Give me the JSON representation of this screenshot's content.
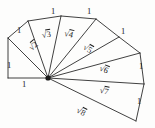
{
  "figure": {
    "type": "geometric-diagram",
    "background_color": "#fdfdfc",
    "stroke_color": "#2b2b2b",
    "text_color": "#1c1c1c",
    "hub": {
      "x": 48,
      "y": 78,
      "label": "origin"
    }
  },
  "unit_labels": [
    {
      "id": "unit-1",
      "text": "1",
      "x": 7,
      "y": 61
    },
    {
      "id": "unit-2",
      "text": "1",
      "x": 22,
      "y": 80
    },
    {
      "id": "unit-3",
      "text": "1",
      "x": 17,
      "y": 26
    },
    {
      "id": "unit-4",
      "text": "1",
      "x": 51,
      "y": 7
    },
    {
      "id": "unit-5",
      "text": "1",
      "x": 87,
      "y": 7
    },
    {
      "id": "unit-6",
      "text": "1",
      "x": 121,
      "y": 27
    },
    {
      "id": "unit-7",
      "text": "1",
      "x": 139,
      "y": 62
    },
    {
      "id": "unit-8",
      "text": "1",
      "x": 137,
      "y": 97
    }
  ],
  "hypotenuse_labels": [
    {
      "id": "sqrt-2",
      "sign": "√",
      "radicand": "2",
      "x": 26,
      "y": 44,
      "rotate": -40
    },
    {
      "id": "sqrt-3",
      "sign": "√",
      "radicand": "3",
      "x": 41,
      "y": 29,
      "rotate": -8
    },
    {
      "id": "sqrt-4",
      "sign": "√",
      "radicand": "4",
      "x": 66,
      "y": 27,
      "rotate": 14
    },
    {
      "id": "sqrt-5",
      "sign": "√",
      "radicand": "5",
      "x": 87,
      "y": 41,
      "rotate": 30
    },
    {
      "id": "sqrt-6",
      "sign": "√",
      "radicand": "6",
      "x": 102,
      "y": 62,
      "rotate": 22
    },
    {
      "id": "sqrt-7",
      "sign": "√",
      "radicand": "7",
      "x": 101,
      "y": 84,
      "rotate": 12
    },
    {
      "id": "sqrt-8",
      "sign": "√",
      "radicand": "8",
      "x": 80,
      "y": 104,
      "rotate": 28
    }
  ],
  "geometry": {
    "spokes": [
      {
        "id": "spoke-r1",
        "from": [
          48,
          78
        ],
        "to": [
          8,
          78
        ]
      },
      {
        "id": "spoke-r2",
        "from": [
          48,
          78
        ],
        "to": [
          8,
          38
        ]
      },
      {
        "id": "spoke-r3",
        "from": [
          48,
          78
        ],
        "to": [
          28,
          21
        ]
      },
      {
        "id": "spoke-r4",
        "from": [
          48,
          78
        ],
        "to": [
          61,
          16
        ]
      },
      {
        "id": "spoke-r5",
        "from": [
          48,
          78
        ],
        "to": [
          96,
          19
        ]
      },
      {
        "id": "spoke-r6",
        "from": [
          48,
          78
        ],
        "to": [
          119,
          37
        ]
      },
      {
        "id": "spoke-r7",
        "from": [
          48,
          78
        ],
        "to": [
          140,
          53
        ]
      },
      {
        "id": "spoke-r8",
        "from": [
          48,
          78
        ],
        "to": [
          144,
          84
        ]
      },
      {
        "id": "spoke-r9",
        "from": [
          48,
          78
        ],
        "to": [
          136,
          121
        ]
      }
    ],
    "outer_edges": [
      {
        "id": "edge-1",
        "from": [
          8,
          78
        ],
        "to": [
          8,
          38
        ]
      },
      {
        "id": "edge-2",
        "from": [
          8,
          38
        ],
        "to": [
          28,
          21
        ]
      },
      {
        "id": "edge-3",
        "from": [
          28,
          21
        ],
        "to": [
          61,
          16
        ]
      },
      {
        "id": "edge-4",
        "from": [
          61,
          16
        ],
        "to": [
          96,
          19
        ]
      },
      {
        "id": "edge-5",
        "from": [
          96,
          19
        ],
        "to": [
          119,
          37
        ]
      },
      {
        "id": "edge-6",
        "from": [
          119,
          37
        ],
        "to": [
          140,
          53
        ]
      },
      {
        "id": "edge-7",
        "from": [
          140,
          53
        ],
        "to": [
          144,
          84
        ]
      },
      {
        "id": "edge-8",
        "from": [
          144,
          84
        ],
        "to": [
          136,
          121
        ]
      }
    ]
  }
}
